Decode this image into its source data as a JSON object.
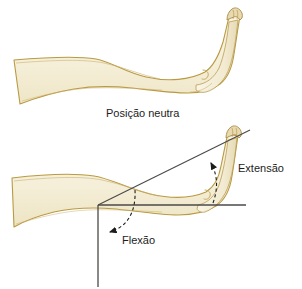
{
  "figure": {
    "title_alt": "Movimentos do tornozelo",
    "background_color": "#ffffff",
    "width": 302,
    "height": 289
  },
  "labels": {
    "neutral_position": "Posição neutra",
    "extension": "Extensão",
    "flexion": "Flexão"
  },
  "colors": {
    "limb_fill": "#f7f2dd",
    "limb_fill_shadow": "#efe6c8",
    "limb_outline": "#b99a42",
    "foot_fill": "#f6f0da",
    "toe_fill": "#e8d9ae",
    "toe_outline": "#a98b49",
    "reference_line": "#4a4a48",
    "dashed_arrow": "#1d1d1b",
    "text": "#1d1d1b"
  },
  "illustrations": [
    {
      "name": "neutral-position-limb",
      "caption": "Posição neutra",
      "description": "Perna e pé vistos de lado na posição neutra"
    },
    {
      "name": "range-of-motion-limb",
      "description": "Perna e pé com linhas de referência mostrando extensão e flexão do tornozelo"
    }
  ],
  "reference_lines": [
    {
      "name": "horizontal-reference-line",
      "orientation": "horizontal"
    },
    {
      "name": "vertical-reference-line",
      "orientation": "vertical"
    },
    {
      "name": "extension-angle-line",
      "orientation": "diagonal"
    }
  ],
  "arrows": [
    {
      "name": "extension-arrow",
      "label": "Extensão",
      "direction": "up"
    },
    {
      "name": "flexion-arrow",
      "label": "Flexão",
      "direction": "left"
    }
  ]
}
